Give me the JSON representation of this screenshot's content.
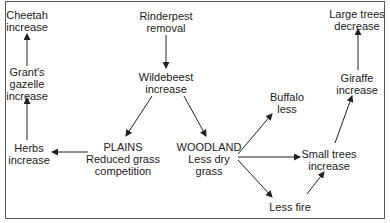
{
  "diagram": {
    "title": "",
    "nodes": {
      "cheetah": {
        "lines": [
          "Cheetah",
          "increase"
        ]
      },
      "grants_gazelle": {
        "lines": [
          "Grant's",
          "gazelle",
          "increase"
        ]
      },
      "herbs": {
        "lines": [
          "Herbs",
          "increase"
        ]
      },
      "rinderpest": {
        "lines": [
          "Rinderpest",
          "removal"
        ]
      },
      "wildebeest": {
        "lines": [
          "Wildebeest",
          "increase"
        ]
      },
      "plains": {
        "lines": [
          "PLAINS",
          "Reduced grass",
          "competition"
        ]
      },
      "woodland": {
        "lines": [
          "WOODLAND",
          "Less dry",
          "grass"
        ]
      },
      "buffalo": {
        "lines": [
          "Buffalo",
          "less"
        ]
      },
      "small_trees": {
        "lines": [
          "Small trees",
          "increase"
        ]
      },
      "less_fire": {
        "lines": [
          "Less fire"
        ]
      },
      "giraffe": {
        "lines": [
          "Giraffe",
          "increase"
        ]
      },
      "large_trees": {
        "lines": [
          "Large trees",
          "decrease"
        ]
      }
    },
    "edges": [
      [
        "rinderpest",
        "wildebeest"
      ],
      [
        "wildebeest",
        "plains"
      ],
      [
        "wildebeest",
        "woodland"
      ],
      [
        "plains",
        "herbs"
      ],
      [
        "herbs",
        "grants_gazelle"
      ],
      [
        "grants_gazelle",
        "cheetah"
      ],
      [
        "woodland",
        "buffalo"
      ],
      [
        "woodland",
        "small_trees"
      ],
      [
        "woodland",
        "less_fire"
      ],
      [
        "less_fire",
        "small_trees"
      ],
      [
        "small_trees",
        "giraffe"
      ],
      [
        "giraffe",
        "large_trees"
      ]
    ],
    "colors": {
      "line": "#222222",
      "border": "#5a5a5a",
      "text": "#222222"
    }
  }
}
